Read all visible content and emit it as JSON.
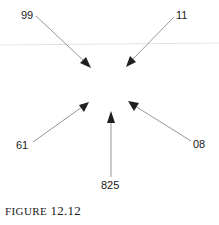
{
  "figure": {
    "caption_prefix": "FIGURE",
    "caption_number": "12.12",
    "colors": {
      "arrow_line": "#8a8a8a",
      "arrow_head": "#1f1f1f",
      "label_text": "#1a1a1a",
      "faint_rule": "#e6e2e2",
      "background": "#ffffff"
    },
    "nodes": [
      {
        "id": "top-left",
        "label": "99"
      },
      {
        "id": "top-right",
        "label": "11"
      },
      {
        "id": "bottom-left",
        "label": "61"
      },
      {
        "id": "bottom-right",
        "label": "08"
      },
      {
        "id": "bottom-center",
        "label": "825"
      }
    ]
  }
}
